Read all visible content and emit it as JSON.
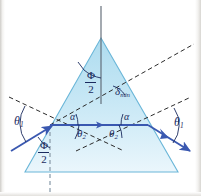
{
  "figure": {
    "colors": {
      "prism_fill_top": "#bfe3f2",
      "prism_fill_bottom": "#e8f5fb",
      "prism_stroke": "#6ab6d8",
      "ray": "#3a58b0",
      "dashed": "#2b2b2b",
      "label": "#1a2a5e",
      "background": "#ffffff"
    },
    "labels": {
      "theta1_left": "θ",
      "theta1_left_sub": "1",
      "theta1_right": "θ",
      "theta1_right_sub": "1",
      "theta2_left": "θ",
      "theta2_left_sub": "2",
      "theta2_right": "θ",
      "theta2_right_sub": "2",
      "alpha_left": "α",
      "alpha_right": "α",
      "delta_min": "δ",
      "delta_min_sub": "min",
      "phi_top_num": "Φ",
      "phi_top_den": "2",
      "phi_bottom_num": "Φ",
      "phi_bottom_den": "2"
    },
    "geometry": {
      "apex": [
        101,
        38
      ],
      "base_left": [
        25,
        172
      ],
      "base_right": [
        178,
        172
      ],
      "entry_point": [
        50,
        125
      ],
      "exit_point": [
        148,
        125
      ],
      "incident_ray_start": [
        11,
        151
      ],
      "exit_ray_end": [
        192,
        152
      ]
    }
  }
}
